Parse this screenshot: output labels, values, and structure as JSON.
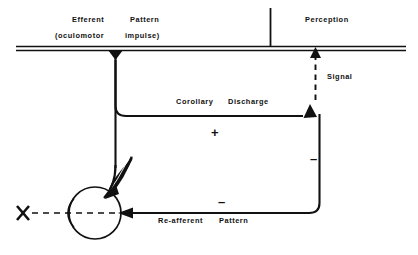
{
  "figure": {
    "background_color": "#ffffff",
    "ink_color": "#111111",
    "width": 418,
    "height": 255
  },
  "labels": {
    "efferent": "Efferent",
    "pattern": "Pattern",
    "oculomotor": "(oculomotor",
    "impulse": "impulse)",
    "perception": "Perception",
    "signal": "Signal",
    "corollary": "Corollary",
    "discharge": "Discharge",
    "reafferent": "Re-afferent",
    "reafferent_pattern": "Pattern"
  },
  "signs": {
    "plus_corollary": "+",
    "minus_right": "–",
    "minus_reafferent": "–"
  },
  "nodes": {
    "target": "X",
    "eye": "eye",
    "extraocular_muscle": "extraocular-muscle"
  },
  "edges": [
    {
      "name": "efferent-outflow",
      "from": "central-bar",
      "to": "eye-muscle",
      "style": "solid",
      "arrow": "down-into-bar-and-muscle"
    },
    {
      "name": "corollary-discharge",
      "from": "efferent-branch",
      "to": "comparator",
      "style": "solid",
      "arrow": "up",
      "sign": "+"
    },
    {
      "name": "signal-to-perception",
      "from": "comparator",
      "to": "perception",
      "style": "dashed",
      "arrow": "up"
    },
    {
      "name": "re-afferent-pattern",
      "from": "eye",
      "to": "comparator",
      "style": "solid",
      "arrow": "left-into-eye",
      "sign": "–"
    },
    {
      "name": "light-ray",
      "from": "target",
      "to": "eye",
      "style": "dashed",
      "arrow": "right"
    }
  ]
}
